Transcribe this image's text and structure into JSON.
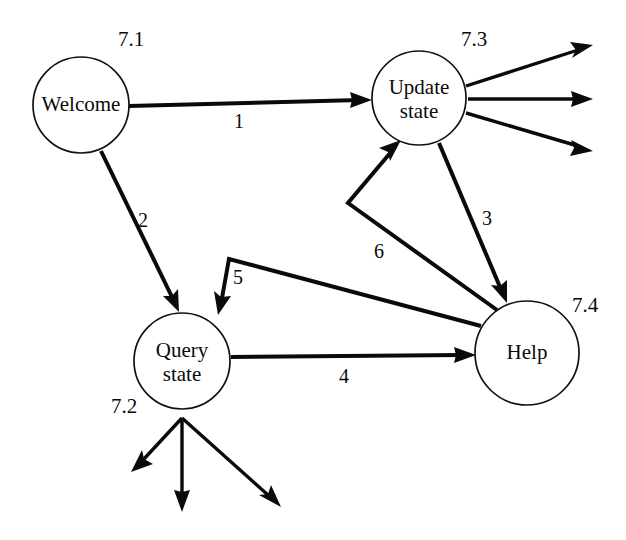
{
  "diagram": {
    "background_color": "#ffffff",
    "line_color": "#0a0a0a",
    "nodes": [
      {
        "key": "welcome",
        "label_line1": "Welcome",
        "label_line2": "",
        "id_label": "7.1",
        "cx": 81,
        "cy": 105,
        "r": 48
      },
      {
        "key": "update_state",
        "label_line1": "Update",
        "label_line2": "state",
        "id_label": "7.3",
        "cx": 419,
        "cy": 98,
        "r": 47
      },
      {
        "key": "query_state",
        "label_line1": "Query",
        "label_line2": "state",
        "id_label": "7.2",
        "cx": 182,
        "cy": 361,
        "r": 48
      },
      {
        "key": "help",
        "label_line1": "Help",
        "label_line2": "",
        "id_label": "7.4",
        "cx": 527,
        "cy": 353,
        "r": 52
      }
    ],
    "node_id_positions": [
      {
        "key": "welcome",
        "text": "7.1",
        "x": 131,
        "y": 41
      },
      {
        "key": "update_state",
        "text": "7.3",
        "x": 474,
        "y": 41
      },
      {
        "key": "query_state",
        "text": "7.2",
        "x": 124,
        "y": 408
      },
      {
        "key": "help",
        "text": "7.4",
        "x": 585,
        "y": 307
      }
    ],
    "edges": [
      {
        "key": "edge-1",
        "label": "1",
        "from": "welcome",
        "to": "update_state",
        "label_x": 239,
        "label_y": 123
      },
      {
        "key": "edge-2",
        "label": "2",
        "from": "welcome",
        "to": "query_state",
        "label_x": 143,
        "label_y": 222
      },
      {
        "key": "edge-3",
        "label": "3",
        "from": "update_state",
        "to": "help",
        "label_x": 487,
        "label_y": 220
      },
      {
        "key": "edge-4",
        "label": "4",
        "from": "query_state",
        "to": "help",
        "label_x": 344,
        "label_y": 378
      },
      {
        "key": "edge-5",
        "label": "5",
        "from": "help",
        "to": "query_state",
        "label_x": 238,
        "label_y": 279
      },
      {
        "key": "edge-6",
        "label": "6",
        "from": "help",
        "to": "update_state",
        "label_x": 379,
        "label_y": 253
      }
    ],
    "external_arrows": {
      "update_state_out": [
        {
          "key": "update-out-1"
        },
        {
          "key": "update-out-2"
        },
        {
          "key": "update-out-3"
        }
      ],
      "query_state_out": [
        {
          "key": "query-out-1"
        },
        {
          "key": "query-out-2"
        },
        {
          "key": "query-out-3"
        }
      ]
    }
  }
}
